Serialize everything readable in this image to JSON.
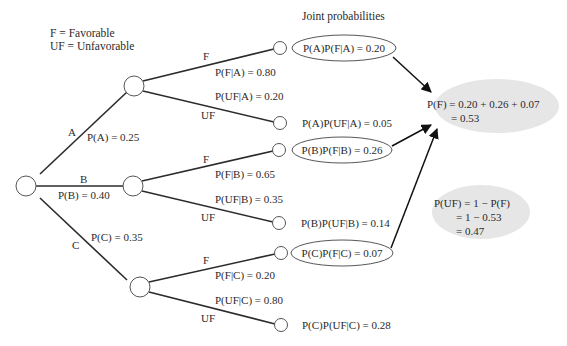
{
  "legend": {
    "favorable": "F = Favorable",
    "unfavorable": "UF = Unfavorable"
  },
  "header": {
    "joint_title": "Joint probabilities"
  },
  "branches": {
    "A": {
      "label": "A",
      "prob": "P(A) = 0.25"
    },
    "B": {
      "label": "B",
      "prob": "P(B) = 0.40"
    },
    "C": {
      "label": "C",
      "prob": "P(C) = 0.35"
    }
  },
  "sub_branches": {
    "A_F": {
      "label": "F",
      "prob": "P(F|A) = 0.80"
    },
    "A_UF": {
      "label": "UF",
      "prob": "P(UF|A) = 0.20"
    },
    "B_F": {
      "label": "F",
      "prob": "P(F|B) = 0.65"
    },
    "B_UF": {
      "label": "UF",
      "prob": "P(UF|B) = 0.35"
    },
    "C_F": {
      "label": "F",
      "prob": "P(F|C) = 0.20"
    },
    "C_UF": {
      "label": "UF",
      "prob": "P(UF|C) = 0.80"
    }
  },
  "joint": {
    "A_F": "P(A)P(F|A) = 0.20",
    "A_UF": "P(A)P(UF|A) = 0.05",
    "B_F": "P(B)P(F|B) = 0.26",
    "B_UF": "P(B)P(UF|B) = 0.14",
    "C_F": "P(C)P(F|C) = 0.07",
    "C_UF": "P(C)P(UF|C) = 0.28"
  },
  "result_F": {
    "line1": "P(F) = 0.20 + 0.26 + 0.07",
    "line2": "= 0.53"
  },
  "result_UF": {
    "line1": "P(UF) = 1 − P(F)",
    "line2": "= 1 − 0.53",
    "line3": "= 0.47"
  }
}
